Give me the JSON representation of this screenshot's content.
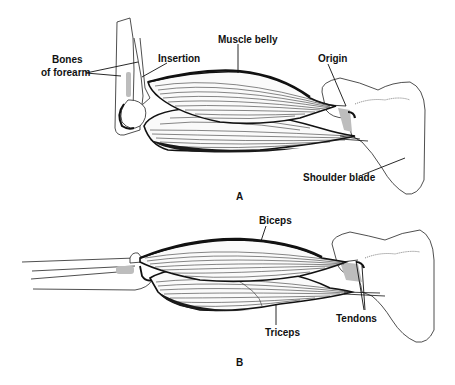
{
  "diagram": {
    "panels": [
      {
        "id": "A",
        "label": "A",
        "callouts": [
          {
            "id": "bones-of-forearm",
            "lines": [
              "Bones",
              "of forearm"
            ]
          },
          {
            "id": "insertion",
            "text": "Insertion"
          },
          {
            "id": "muscle-belly",
            "text": "Muscle belly"
          },
          {
            "id": "origin",
            "text": "Origin"
          },
          {
            "id": "shoulder-blade",
            "text": "Shoulder blade"
          }
        ]
      },
      {
        "id": "B",
        "label": "B",
        "callouts": [
          {
            "id": "biceps",
            "text": "Biceps"
          },
          {
            "id": "triceps",
            "text": "Triceps"
          },
          {
            "id": "tendons",
            "text": "Tendons"
          }
        ]
      }
    ]
  }
}
